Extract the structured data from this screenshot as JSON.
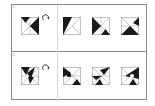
{
  "questions": [
    {
      "number": "1",
      "prompt_figure": "square-with-triangles-rotate",
      "rotation_icon": "rotate-clockwise-arrow",
      "options": [
        "option-a",
        "option-b",
        "option-c"
      ]
    },
    {
      "number": "2",
      "prompt_figure": "square-with-triangles-and-circle-rotate",
      "rotation_icon": "rotate-clockwise-arrow",
      "options": [
        "option-a",
        "option-b",
        "option-c"
      ]
    }
  ],
  "colors": {
    "fill": "#1a1a1a",
    "line": "#9a9a9a",
    "border": "#8a8a8a"
  }
}
